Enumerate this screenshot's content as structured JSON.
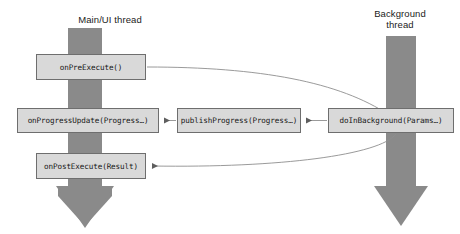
{
  "diagram": {
    "background_color": "#ffffff",
    "lane_color": "#808080",
    "box_fill": "#d9d9d9",
    "box_border": "#6e6e6e",
    "connector_color": "#7a7a7a",
    "lanes": [
      {
        "id": "main-ui",
        "label": "Main/UI thread",
        "x_center": 85
      },
      {
        "id": "background",
        "label": "Background\nthread",
        "x_center": 400
      }
    ],
    "nodes": [
      {
        "id": "on-pre-execute",
        "label": "onPreExecute()",
        "lane": "main-ui"
      },
      {
        "id": "on-progress-update",
        "label": "onProgressUpdate(Progress…)",
        "lane": "main-ui"
      },
      {
        "id": "publish-progress",
        "label": "publishProgress(Progress…)",
        "lane": "between"
      },
      {
        "id": "do-in-background",
        "label": "doInBackground(Params…)",
        "lane": "background"
      },
      {
        "id": "on-post-execute",
        "label": "onPostExecute(Result)",
        "lane": "main-ui"
      }
    ],
    "connectors": [
      {
        "id": "pre-execute-to-do-in-background",
        "from": "on-pre-execute",
        "to": "do-in-background",
        "style": "curved"
      },
      {
        "id": "publish-progress-to-on-progress-update",
        "from": "publish-progress",
        "to": "on-progress-update",
        "style": "straight"
      },
      {
        "id": "do-in-background-to-publish-progress",
        "from": "do-in-background",
        "to": "publish-progress",
        "style": "straight"
      },
      {
        "id": "do-in-background-to-on-post-execute",
        "from": "do-in-background",
        "to": "on-post-execute",
        "style": "curved"
      }
    ]
  }
}
